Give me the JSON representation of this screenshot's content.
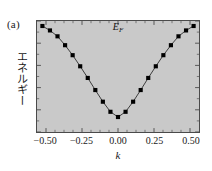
{
  "figure": {
    "panel_label": "(a)",
    "background_color": "#ffffff",
    "plot_background_color": "#c9c9c9",
    "frame_color": "#4a4a4a",
    "marker_color": "#000000",
    "line_color": "#2b2b2b"
  },
  "chart_data": {
    "type": "line",
    "title": "",
    "subtitle": "",
    "xlabel": "k",
    "ylabel": "エネルギー",
    "xlim": [
      -0.5625,
      0.5625
    ],
    "ylim": [
      0,
      1
    ],
    "grid": false,
    "legend": null,
    "legend_position": "none",
    "xticks": [
      -0.5,
      -0.25,
      0,
      0.25,
      0.5
    ],
    "xticklabels": [
      "-0.50",
      "-0.25",
      "0.00",
      "0.25",
      "0.50"
    ],
    "yticks": [],
    "yticklabels": [],
    "annotations": [
      {
        "name": "fermi-energy",
        "text": "E",
        "subscript": "F",
        "x": 0,
        "y": 1.0,
        "position": "top-center"
      }
    ],
    "series": [
      {
        "name": "band-dispersion",
        "marker": "square",
        "x": [
          -0.525,
          -0.4725,
          -0.42,
          -0.3675,
          -0.315,
          -0.2625,
          -0.21,
          -0.1575,
          -0.105,
          -0.0525,
          0.0,
          0.0525,
          0.105,
          0.1575,
          0.21,
          0.2625,
          0.315,
          0.3675,
          0.42,
          0.4725,
          0.525
        ],
        "y": [
          0.955,
          0.915,
          0.862,
          0.782,
          0.692,
          0.592,
          0.487,
          0.378,
          0.273,
          0.182,
          0.135,
          0.182,
          0.273,
          0.378,
          0.487,
          0.592,
          0.692,
          0.782,
          0.862,
          0.915,
          0.955
        ]
      }
    ]
  }
}
